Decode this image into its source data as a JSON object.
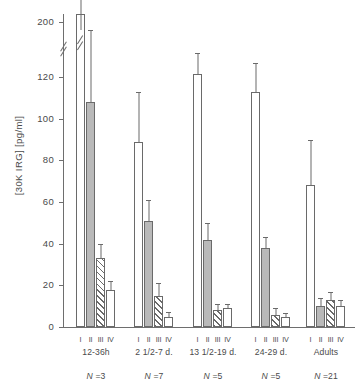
{
  "chart_data": {
    "type": "bar",
    "title": "",
    "xlabel": "",
    "ylabel": "[30K IRG] [pg/ml]",
    "ylim": [
      0,
      200
    ],
    "grid": false,
    "legend_position": "none",
    "y_ticks": [
      0,
      20,
      40,
      60,
      80,
      100,
      120,
      200
    ],
    "y_tick_labels": [
      "0",
      "20",
      "40",
      "60",
      "80",
      "100",
      "120",
      "200"
    ],
    "axis_break_between": [
      120,
      200
    ],
    "bar_labels": [
      "I",
      "II",
      "III",
      "IV"
    ],
    "categories": [
      "12-36h",
      "2 1/2-7 d.",
      "13 1/2-19 d.",
      "24-29 d.",
      "Adults"
    ],
    "group_counts": [
      "N =3",
      "N =7",
      "N =5",
      "N =5",
      "N =21"
    ],
    "series": [
      {
        "name": "I",
        "style": "white",
        "values": [
          215,
          89,
          125,
          113,
          68
        ],
        "errors": [
          20,
          24,
          30,
          28,
          22
        ],
        "truncated": [
          true,
          false,
          false,
          false,
          false
        ]
      },
      {
        "name": "II",
        "style": "gray",
        "values": [
          108,
          51,
          42,
          38,
          10
        ],
        "errors": [
          80,
          10,
          8,
          5,
          4
        ],
        "truncated": [
          false,
          false,
          false,
          false,
          false
        ]
      },
      {
        "name": "III",
        "style": "hatch",
        "values": [
          33,
          15,
          8,
          6,
          13
        ],
        "errors": [
          7,
          6,
          3,
          3,
          4
        ],
        "truncated": [
          false,
          false,
          false,
          false,
          false
        ]
      },
      {
        "name": "IV",
        "style": "white",
        "values": [
          18,
          5,
          9,
          5,
          10
        ],
        "errors": [
          4,
          2,
          1,
          1,
          3
        ],
        "truncated": [
          false,
          false,
          false,
          false,
          false
        ]
      }
    ]
  }
}
